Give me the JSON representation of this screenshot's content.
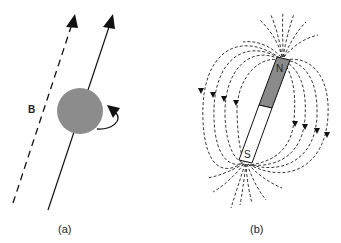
{
  "panel_a": {
    "caption": "(a)",
    "field_label": "B",
    "sphere_color": "#8c8c8c",
    "description": "Spinning particle precessing about magnetic field B"
  },
  "panel_b": {
    "caption": "(b)",
    "north_label": "N",
    "south_label": "S",
    "north_color": "#8a8a8a",
    "south_color": "#ffffff",
    "description": "Bar magnet with dashed magnetic field lines"
  }
}
